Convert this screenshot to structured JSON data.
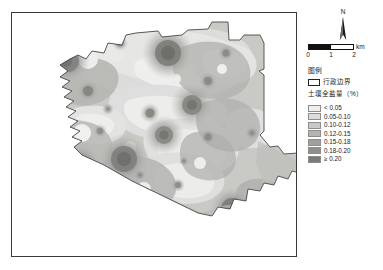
{
  "map": {
    "title": "",
    "frame": {
      "border_color": "#3a3a3a"
    }
  },
  "north_arrow": {
    "label": "N",
    "icon": "north-arrow-icon"
  },
  "scale_bar": {
    "unit": "km",
    "ticks": [
      "0",
      "1",
      "2"
    ],
    "segments": [
      "dark",
      "light"
    ]
  },
  "legend": {
    "title": "图例",
    "boundary": {
      "label": "行政边界",
      "swatch_color": "#ffffff",
      "swatch_border": "#222222"
    },
    "subtitle": "土壤全盐量（%）",
    "classes": [
      {
        "label": "< 0.05",
        "color": "#eeeeec"
      },
      {
        "label": "0.05-0.10",
        "color": "#dcdcda"
      },
      {
        "label": "0.10-0.12",
        "color": "#c9c9c6"
      },
      {
        "label": "0.12-0.15",
        "color": "#b4b4b1"
      },
      {
        "label": "0.15-0.18",
        "color": "#a0a09d"
      },
      {
        "label": "0.18-0.20",
        "color": "#8e8e8b"
      },
      {
        "label": "≥ 0.20",
        "color": "#7a7a77"
      }
    ]
  },
  "chart_data": {
    "type": "heatmap",
    "xlabel": "",
    "ylabel": "",
    "legend_position": "right",
    "grid": false,
    "class_breaks": [
      0.05,
      0.1,
      0.12,
      0.15,
      0.18,
      0.2
    ],
    "class_labels": [
      "< 0.05",
      "0.05-0.10",
      "0.10-0.12",
      "0.12-0.15",
      "0.15-0.18",
      "0.18-0.20",
      "≥ 0.20"
    ],
    "class_colors": [
      "#eeeeec",
      "#dcdcda",
      "#c9c9c6",
      "#b4b4b1",
      "#a0a09d",
      "#8e8e8b",
      "#7a7a77"
    ],
    "units": "%",
    "scale_km": 2,
    "hotspots": [
      {
        "x": 0.56,
        "y": 0.17,
        "value": 0.21
      },
      {
        "x": 0.19,
        "y": 0.21,
        "value": 0.19
      },
      {
        "x": 0.64,
        "y": 0.38,
        "value": 0.19
      },
      {
        "x": 0.54,
        "y": 0.5,
        "value": 0.18
      },
      {
        "x": 0.4,
        "y": 0.6,
        "value": 0.2
      },
      {
        "x": 0.24,
        "y": 0.62,
        "value": 0.19
      },
      {
        "x": 0.15,
        "y": 0.46,
        "value": 0.18
      },
      {
        "x": 0.78,
        "y": 0.8,
        "value": 0.21
      },
      {
        "x": 0.27,
        "y": 0.32,
        "value": 0.17
      },
      {
        "x": 0.49,
        "y": 0.41,
        "value": 0.17
      }
    ],
    "lowspots": [
      {
        "x": 0.22,
        "y": 0.12,
        "value": 0.04
      },
      {
        "x": 0.35,
        "y": 0.14,
        "value": 0.04
      },
      {
        "x": 0.44,
        "y": 0.21,
        "value": 0.04
      },
      {
        "x": 0.31,
        "y": 0.4,
        "value": 0.04
      },
      {
        "x": 0.14,
        "y": 0.52,
        "value": 0.04
      },
      {
        "x": 0.45,
        "y": 0.58,
        "value": 0.04
      },
      {
        "x": 0.7,
        "y": 0.25,
        "value": 0.04
      },
      {
        "x": 0.6,
        "y": 0.68,
        "value": 0.04
      }
    ]
  }
}
